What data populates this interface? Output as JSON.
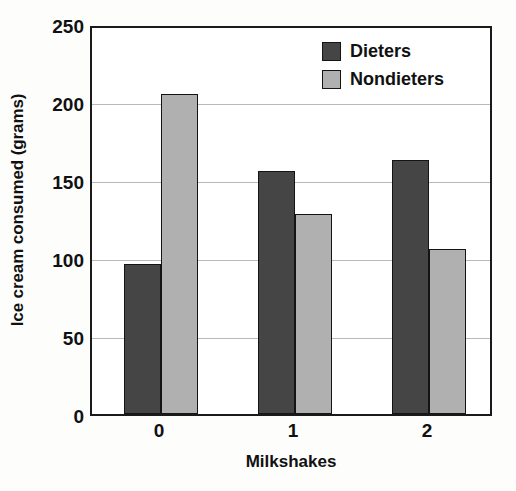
{
  "chart_data": {
    "type": "bar",
    "title": "",
    "subtitle": "",
    "xlabel": "Milkshakes",
    "ylabel": "Ice cream consumed (grams)",
    "categories": [
      "0",
      "1",
      "2"
    ],
    "series": [
      {
        "name": "Dieters",
        "values": [
          96,
          156,
          163
        ],
        "color": "#454545"
      },
      {
        "name": "Nondieters",
        "values": [
          205,
          128,
          106
        ],
        "color": "#b0b0b0"
      }
    ],
    "ylim": [
      0,
      250
    ],
    "yticks": [
      0,
      50,
      100,
      150,
      200,
      250
    ],
    "ytick_labels": [
      "0",
      "50",
      "100",
      "150",
      "200",
      "250"
    ],
    "grid": "horizontal",
    "legend_position": "top-right",
    "frame": "box",
    "annotations": []
  },
  "legend": {
    "entries": [
      {
        "label": "Dieters"
      },
      {
        "label": "Nondieters"
      }
    ]
  },
  "colors": {
    "dieters": "#454545",
    "nondieters": "#b0b0b0",
    "axis": "#1a1a1a",
    "grid": "#b9b9b9",
    "background": "#ffffff"
  }
}
